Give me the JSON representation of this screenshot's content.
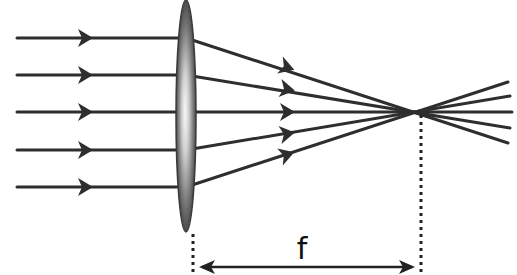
{
  "diagram": {
    "type": "converging-lens-ray-diagram",
    "focal_length_label": "f",
    "colors": {
      "ray": "#2e2e2e",
      "lens_edge": "#444444",
      "lens_dark": "#4a4a4a",
      "lens_light": "#f4f4f4",
      "background": "#ffffff"
    },
    "lens": {
      "cx": 186,
      "cy": 116,
      "rx": 10,
      "ry": 116
    },
    "focal_point": {
      "x": 420,
      "y": 112
    },
    "incident_rays_y": [
      38,
      75,
      112,
      150,
      187
    ]
  }
}
